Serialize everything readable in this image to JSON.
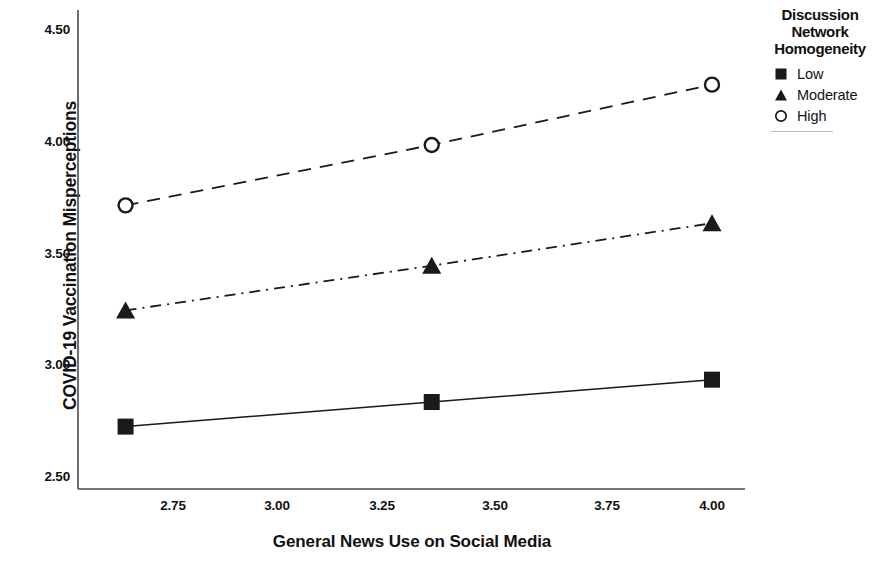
{
  "chart_data": {
    "type": "line",
    "title": "",
    "xlabel": "General News Use on Social Media",
    "ylabel": "COVID-19 Vaccination Misperceptions",
    "xlim": [
      2.52,
      4.12
    ],
    "ylim": [
      2.38,
      4.62
    ],
    "xticks": [
      "2.75",
      "3.00",
      "3.25",
      "3.50",
      "3.75",
      "4.00"
    ],
    "xtick_values": [
      2.75,
      3.0,
      3.25,
      3.5,
      3.75,
      4.0
    ],
    "yticks": [
      "2.50",
      "3.00",
      "3.50",
      "4.00",
      "4.50"
    ],
    "ytick_values": [
      2.5,
      3.0,
      3.5,
      4.0,
      4.5
    ],
    "grid": false,
    "legend_position": "right",
    "x": [
      2.64,
      3.35,
      4.0
    ],
    "series": [
      {
        "name": "Low",
        "marker": "filled-square",
        "linestyle": "solid",
        "color": "#1a1a1a",
        "values": [
          2.73,
          2.84,
          2.94
        ]
      },
      {
        "name": "Moderate",
        "marker": "filled-triangle",
        "linestyle": "dash-dot",
        "color": "#1a1a1a",
        "values": [
          3.25,
          3.45,
          3.64
        ]
      },
      {
        "name": "High",
        "marker": "open-circle",
        "linestyle": "dashed",
        "color": "#1a1a1a",
        "values": [
          3.72,
          3.99,
          4.26
        ]
      }
    ]
  },
  "legend": {
    "title": "Discussion\nNetwork\nHomogeneity",
    "items": [
      {
        "label": "Low",
        "marker": "filled-square"
      },
      {
        "label": "Moderate",
        "marker": "filled-triangle"
      },
      {
        "label": "High",
        "marker": "open-circle"
      }
    ]
  },
  "axis": {
    "axis_color": "#4a4a4a"
  }
}
